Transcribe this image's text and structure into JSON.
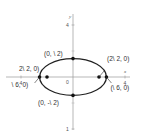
{
  "figure": {
    "type": "ellipse-diagram",
    "axes": {
      "x_label": "x",
      "y_label": "y",
      "origin_label": "0",
      "x_ticks": [
        {
          "value": -4,
          "label": "4"
        },
        {
          "value": 4,
          "label": "4"
        }
      ],
      "y_ticks": [
        {
          "value": 4,
          "label": "4"
        },
        {
          "value": -4,
          "label": "1"
        }
      ],
      "range": {
        "x": [
          -5,
          5
        ],
        "y": [
          -5,
          5
        ]
      }
    },
    "ellipse": {
      "center": [
        0,
        0
      ],
      "semi_major_x": 2.449,
      "semi_minor_y": 1.414,
      "color": "#222222"
    },
    "points": [
      {
        "id": "top",
        "x": 0,
        "y": 1.414,
        "label": "(0, \\ 2)"
      },
      {
        "id": "bottom",
        "x": 0,
        "y": -1.414,
        "label": "(0, -\\ 2)"
      },
      {
        "id": "right-inner",
        "x": 2.0,
        "y": 0,
        "label": "(2\\ 2, 0)"
      },
      {
        "id": "right-outer",
        "x": 2.449,
        "y": 0,
        "label": "(\\ 6, 0)"
      },
      {
        "id": "left-inner",
        "x": -2.0,
        "y": 0,
        "label": "2\\ 2, 0)"
      },
      {
        "id": "left-outer",
        "x": -2.449,
        "y": 0,
        "label": "\\ 6, 0)"
      }
    ]
  }
}
